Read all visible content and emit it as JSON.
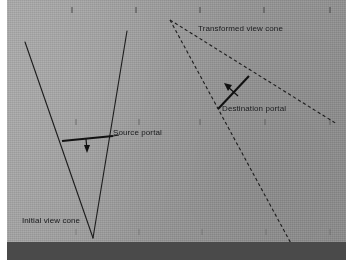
{
  "figure": {
    "kind": "line-diagram",
    "title_text": "",
    "background_color": "#9e9e9e",
    "ink_color": "#1a1a1a",
    "margin_color": "#ffffff"
  },
  "labels": {
    "initial_view_cone": "Initial view cone",
    "source_portal": "Source portal",
    "transformed_view_cone": "Transformed view cone",
    "destination_portal": "Destination portal"
  },
  "geometry": {
    "initial_cone": {
      "style": "solid",
      "apex": [
        93,
        238
      ],
      "left_ray_end": [
        25,
        42
      ],
      "right_ray_end": [
        127,
        31
      ]
    },
    "transformed_cone": {
      "style": "dashed",
      "apex": [
        170,
        20
      ],
      "upper_ray_end": [
        336,
        124
      ],
      "lower_ray_end": [
        293,
        249
      ]
    },
    "source_portal_segment": {
      "from": [
        62,
        141
      ],
      "to": [
        113,
        137
      ],
      "arrow_from": [
        86,
        139
      ],
      "arrow_to": [
        87,
        152
      ],
      "stroke_width": 2
    },
    "destination_portal_segment": {
      "from": [
        218,
        109
      ],
      "to": [
        249,
        76
      ],
      "arrow_from": [
        236,
        96
      ],
      "arrow_to": [
        224,
        85
      ],
      "stroke_width": 2
    },
    "tick_marks_rows": [
      {
        "y": 10,
        "xs": [
          72,
          136,
          200,
          264,
          330
        ]
      },
      {
        "y": 122,
        "xs": [
          76,
          139,
          200,
          265,
          330
        ]
      },
      {
        "y": 232,
        "xs": [
          76,
          139,
          202,
          266,
          330
        ]
      }
    ],
    "tick_length": 6
  },
  "label_positions": {
    "initial_view_cone": [
      22,
      222
    ],
    "source_portal": [
      113,
      131
    ],
    "transformed_view_cone": [
      198,
      27
    ],
    "destination_portal": [
      222,
      108
    ]
  }
}
